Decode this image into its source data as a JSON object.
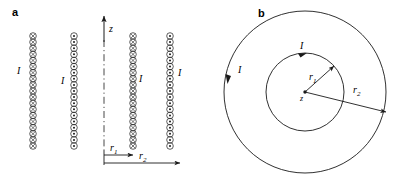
{
  "figure": {
    "width": 402,
    "height": 176,
    "background": "#ffffff",
    "stroke_color": "#1a1a1a"
  },
  "panel_a": {
    "label": "a",
    "axis": {
      "z_label": "z",
      "centerline_style": "dash-dot",
      "centerline_x": 104,
      "centerline_top": 22,
      "centerline_bottom": 148
    },
    "coil_columns": [
      {
        "name": "column-1-into-page",
        "symbol": "cross",
        "symbol_name": "current-into-page",
        "x": 33,
        "top": 36,
        "bottom": 146,
        "turns": 19,
        "current_label": "I",
        "label_x": 17,
        "label_y": 66
      },
      {
        "name": "column-2-out-of-page",
        "symbol": "dot",
        "symbol_name": "current-out-of-page",
        "x": 74,
        "top": 36,
        "bottom": 146,
        "turns": 19,
        "current_label": "I",
        "label_x": 61,
        "label_y": 76
      },
      {
        "name": "column-3-into-page",
        "symbol": "cross",
        "symbol_name": "current-into-page",
        "x": 133,
        "top": 36,
        "bottom": 146,
        "turns": 19,
        "current_label": "I",
        "label_x": 139,
        "label_y": 74
      },
      {
        "name": "column-4-out-of-page",
        "symbol": "dot",
        "symbol_name": "current-out-of-page",
        "x": 170,
        "top": 36,
        "bottom": 146,
        "turns": 19,
        "current_label": "I",
        "label_x": 178,
        "label_y": 68
      }
    ],
    "radius_arrows": [
      {
        "name": "r1-arrow",
        "label": "r",
        "subscript": "1",
        "from_x": 104,
        "to_x": 133,
        "y": 155,
        "label_x": 110,
        "label_y": 144
      },
      {
        "name": "r2-arrow",
        "label": "r",
        "subscript": "2",
        "from_x": 104,
        "to_x": 179,
        "y": 163,
        "label_x": 139,
        "label_y": 152
      }
    ]
  },
  "panel_b": {
    "label": "b",
    "center": {
      "x": 104,
      "y": 92,
      "label": "z"
    },
    "circles": [
      {
        "name": "inner-circle",
        "radius": 39,
        "current_label": "I",
        "current_label_x": 99,
        "current_label_y": 45,
        "arrow_direction": "clockwise-top"
      },
      {
        "name": "outer-circle",
        "radius": 81,
        "current_label": "I",
        "current_label_x": 59,
        "current_label_y": 68,
        "arrow_direction": "clockwise-left"
      }
    ],
    "radius_arrows": [
      {
        "name": "r1-arrow",
        "label": "r",
        "subscript": "1",
        "angle_deg": -45,
        "length": 39,
        "label_x": 83,
        "label_y": 77
      },
      {
        "name": "r2-arrow",
        "label": "r",
        "subscript": "2",
        "angle_deg": 14,
        "length": 81,
        "label_x": 125,
        "label_y": 86
      }
    ]
  }
}
